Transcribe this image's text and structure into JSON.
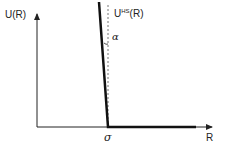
{
  "diagram": {
    "type": "potential-energy-plot",
    "y_axis_label": "U(R)",
    "x_axis_label": "R",
    "curve_label_main": "U",
    "curve_label_sup": "HS",
    "curve_label_arg": "(R)",
    "angle_label": "α",
    "x_tick_label": "σ",
    "colors": {
      "axis": "#222222",
      "curve": "#111111",
      "dashed": "#777777",
      "background": "#ffffff"
    }
  }
}
